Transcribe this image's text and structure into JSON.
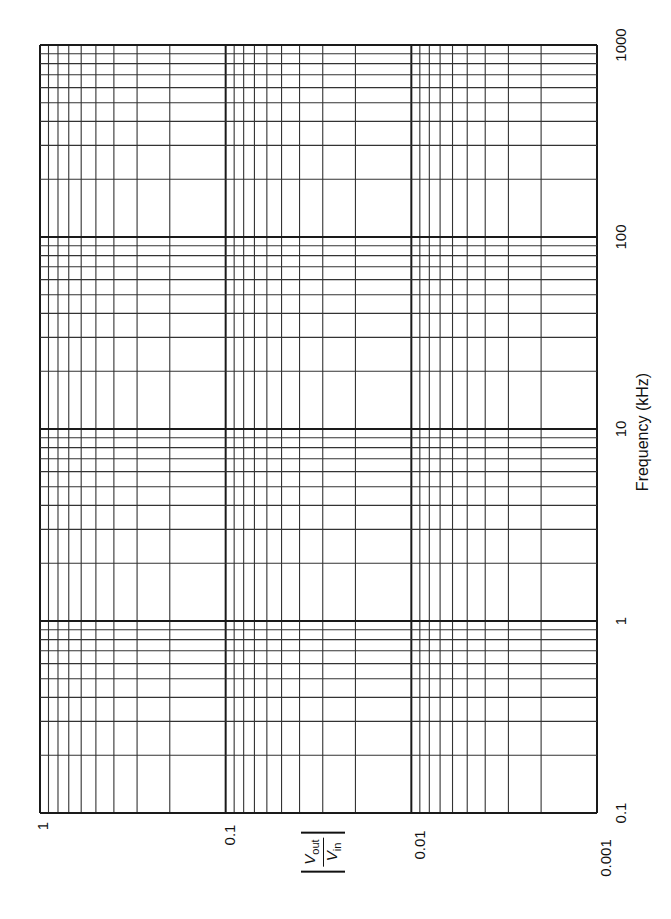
{
  "chart_data": {
    "type": "line",
    "title": "",
    "subtitle": "Blank log-log graph paper (rotated 90°) for a frequency response plot",
    "xlabel": "Frequency (kHz)",
    "ylabel": "|Vout/Vin|",
    "xscale": "log",
    "yscale": "log",
    "xlim": [
      0.1,
      1000
    ],
    "ylim": [
      0.001,
      1
    ],
    "x_ticks": [
      "0.1",
      "1",
      "10",
      "100",
      "1000"
    ],
    "y_ticks": [
      "1",
      "0.1",
      "0.01",
      "0.001"
    ],
    "grid": true,
    "minor_grid": true,
    "orientation": "rotated -90 degrees (frequency axis runs vertically on right, magnitude axis runs horizontally along bottom)",
    "series": []
  },
  "labels": {
    "freq_axis_title": "Frequency (kHz)",
    "mag_axis_num": "V",
    "mag_axis_num_sub": "out",
    "mag_axis_den": "V",
    "mag_axis_den_sub": "in",
    "freq_ticks": [
      {
        "text": "1000",
        "y": 45
      },
      {
        "text": "100",
        "y": 237
      },
      {
        "text": "10",
        "y": 429
      },
      {
        "text": "1",
        "y": 621
      },
      {
        "text": "0.1",
        "y": 813
      }
    ],
    "mag_ticks": [
      {
        "text": "1",
        "x": 40
      },
      {
        "text": "0.1",
        "x": 225
      },
      {
        "text": "0.01",
        "x": 411
      },
      {
        "text": "0.001",
        "x": 597
      }
    ]
  },
  "style": {
    "grid_color": "#1a1a1a",
    "minor_color": "#333333"
  }
}
